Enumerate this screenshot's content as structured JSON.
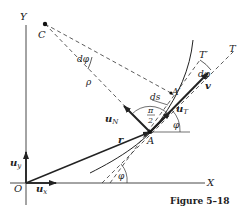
{
  "figure": {
    "caption": "Figure 5–18"
  },
  "axes": {
    "x_label": "X",
    "y_label": "Y",
    "origin_label": "O",
    "unit_x": "u",
    "unit_x_sub": "x",
    "unit_y": "u",
    "unit_y_sub": "y"
  },
  "points": {
    "center": "C",
    "point_a": "A",
    "point_a_prime": "A′"
  },
  "vectors": {
    "position": "r",
    "velocity": "v",
    "tangent": "u",
    "tangent_sub": "T",
    "normal": "u",
    "normal_sub": "N"
  },
  "lines": {
    "tangent_line": "T",
    "tangent_line_prime": "T′"
  },
  "annotations": {
    "radius": "ρ",
    "d_phi_center": "dφ",
    "d_phi_tangent": "dφ",
    "arc_length": "ds",
    "right_angle_num": "π",
    "right_angle_den": "2",
    "phi_at_a": "φ",
    "phi_at_axis": "φ"
  },
  "colors": {
    "ink": "#222222",
    "background": "#ffffff"
  }
}
